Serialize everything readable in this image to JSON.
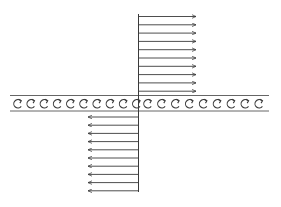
{
  "diagram": {
    "type": "shear-layer-vortex-sheet",
    "colors": {
      "stroke": "#3a3a3a",
      "band": "#555555",
      "background": "#ffffff"
    },
    "upper_flow": {
      "direction": "right",
      "arrow_count": 10,
      "x_start": 138,
      "x_end": 196,
      "y_first": 16.5,
      "y_step": 8.3
    },
    "lower_flow": {
      "direction": "left",
      "arrow_count": 10,
      "x_start": 139,
      "x_end": 88,
      "y_first": 117,
      "y_step": 8.2
    },
    "vortex_band": {
      "y_top": 95.5,
      "y_bottom": 111,
      "x_left": 10,
      "x_right": 269,
      "vortex_count": 19,
      "vortex_symbol": "clockwise-arrow-circle"
    },
    "dividing_line": {
      "x": 138.5,
      "y_top": 14,
      "y_bottom": 192
    }
  }
}
